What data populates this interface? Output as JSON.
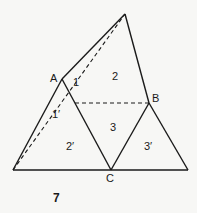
{
  "figure": {
    "number": "7",
    "points": {
      "top": [
        125,
        14
      ],
      "A": [
        62,
        79
      ],
      "B": [
        149,
        103
      ],
      "C": [
        111,
        170
      ],
      "bottom_left": [
        13,
        170
      ],
      "bottom_right": [
        188,
        170
      ],
      "inner": [
        75,
        103
      ]
    },
    "vertex_labels": {
      "A": "A",
      "B": "B",
      "C": "C"
    },
    "region_labels": {
      "r1": "1",
      "r2": "2",
      "r3": "3",
      "r1p": "1′",
      "r2p": "2′",
      "r3p": "3′"
    },
    "colors": {
      "line": "#1a1a1a",
      "background": "#f7f7f5"
    }
  }
}
